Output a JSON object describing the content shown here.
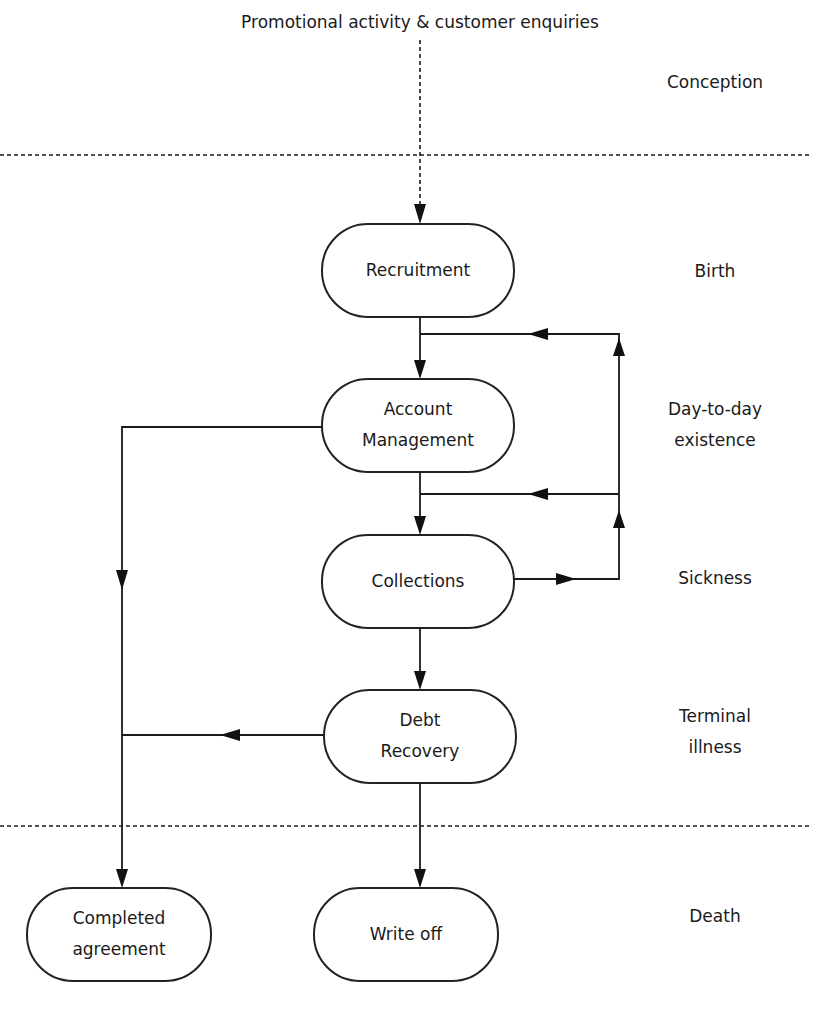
{
  "diagram": {
    "source_label": "Promotional activity & customer enquiries",
    "stages": {
      "conception": "Conception",
      "birth": "Birth",
      "day_to_day": [
        "Day-to-day",
        "existence"
      ],
      "sickness": "Sickness",
      "terminal": [
        "Terminal",
        "illness"
      ],
      "death": "Death"
    },
    "nodes": {
      "recruitment": "Recruitment",
      "account_management": [
        "Account",
        "Management"
      ],
      "collections": "Collections",
      "debt_recovery": [
        "Debt",
        "Recovery"
      ],
      "completed_agreement": [
        "Completed",
        "agreement"
      ],
      "write_off": "Write off"
    }
  }
}
